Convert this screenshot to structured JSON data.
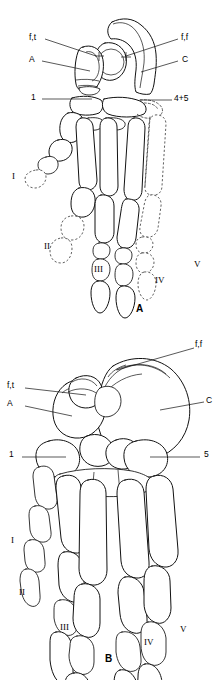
{
  "figure": {
    "title": "",
    "background_color": "#ffffff",
    "ink_color": "#111111",
    "dashed_color": "#444444"
  },
  "panels": [
    {
      "id": "A",
      "letter": "A",
      "letter_x": 136,
      "letter_y": 305,
      "view": "dorsal",
      "labels": [
        {
          "id": "ft-left",
          "text": "f,t",
          "x": 33,
          "y": 40,
          "side": "left",
          "leader_to_x": 92,
          "leader_to_y": 56
        },
        {
          "id": "a-left",
          "text": "A",
          "x": 33,
          "y": 63,
          "side": "left",
          "leader_to_x": 90,
          "leader_to_y": 72
        },
        {
          "id": "one-left",
          "text": "1",
          "x": 35,
          "y": 101,
          "side": "left",
          "leader_to_x": 90,
          "leader_to_y": 99
        },
        {
          "id": "ff-right",
          "text": "f,f",
          "x": 180,
          "y": 40,
          "side": "right",
          "leader_to_x": 123,
          "leader_to_y": 56
        },
        {
          "id": "c-right",
          "text": "C",
          "x": 181,
          "y": 63,
          "side": "right",
          "leader_to_x": 139,
          "leader_to_y": 72
        },
        {
          "id": "45-right",
          "text": "4+5",
          "x": 174,
          "y": 102,
          "side": "right",
          "leader_to_x": 143,
          "leader_to_y": 100
        }
      ],
      "digits": [
        {
          "id": "I",
          "numeral": "I",
          "x": 14,
          "y": 177,
          "style": "dashed-tip"
        },
        {
          "id": "II",
          "numeral": "II",
          "x": 47,
          "y": 247,
          "style": "dashed-tip"
        },
        {
          "id": "III",
          "numeral": "III",
          "x": 97,
          "y": 270,
          "style": "solid"
        },
        {
          "id": "IV",
          "numeral": "IV",
          "x": 157,
          "y": 281,
          "style": "solid"
        },
        {
          "id": "V",
          "numeral": "V",
          "x": 196,
          "y": 265,
          "style": "dashed"
        }
      ]
    },
    {
      "id": "B",
      "letter": "B",
      "letter_x": 105,
      "letter_y": 655,
      "view": "perspective",
      "labels": [
        {
          "id": "ff-right-b",
          "text": "f,f",
          "x": 196,
          "y": 346,
          "side": "right",
          "leader_to_x": 148,
          "leader_to_y": 362
        },
        {
          "id": "ft-left-b",
          "text": "f,t",
          "x": 11,
          "y": 386,
          "side": "left",
          "leader_to_x": 73,
          "leader_to_y": 396
        },
        {
          "id": "a-left-b",
          "text": "A",
          "x": 11,
          "y": 404,
          "side": "left",
          "leader_to_x": 70,
          "leader_to_y": 415
        },
        {
          "id": "c-right-b",
          "text": "C",
          "x": 206,
          "y": 400,
          "side": "right",
          "leader_to_x": 165,
          "leader_to_y": 409
        },
        {
          "id": "one-left-b",
          "text": "1",
          "x": 13,
          "y": 456,
          "side": "left",
          "leader_to_x": 70,
          "leader_to_y": 456
        },
        {
          "id": "five-right-b",
          "text": "5",
          "x": 204,
          "y": 456,
          "side": "right",
          "leader_to_x": 148,
          "leader_to_y": 456
        }
      ],
      "digits": [
        {
          "id": "I",
          "numeral": "I",
          "x": 13,
          "y": 541
        },
        {
          "id": "II",
          "numeral": "II",
          "x": 21,
          "y": 593
        },
        {
          "id": "III",
          "numeral": "III",
          "x": 62,
          "y": 628
        },
        {
          "id": "IV",
          "numeral": "IV",
          "x": 146,
          "y": 643
        },
        {
          "id": "V",
          "numeral": "V",
          "x": 181,
          "y": 630
        }
      ]
    }
  ],
  "legend_keys": {
    "ft": "f,t",
    "ff": "f,f",
    "A": "A",
    "C": "C",
    "one": "1",
    "five": "5",
    "four_plus_five": "4+5"
  }
}
